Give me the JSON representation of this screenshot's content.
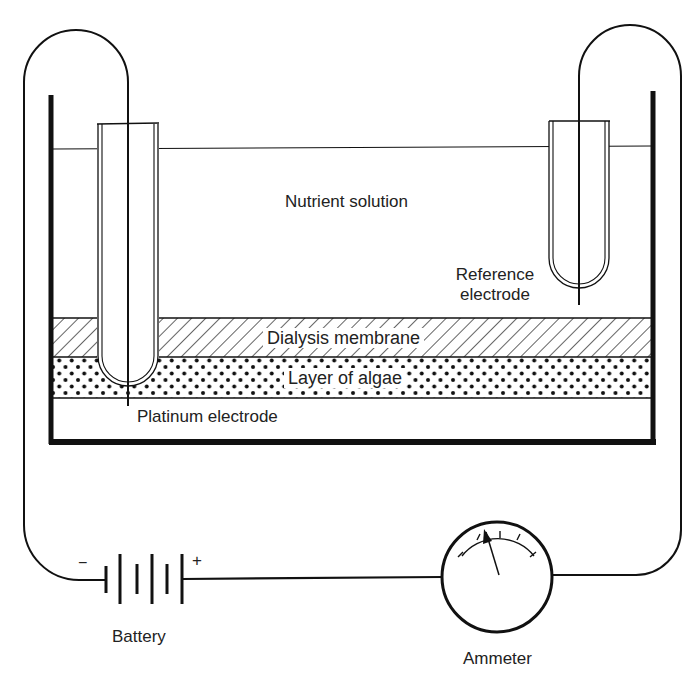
{
  "diagram": {
    "labels": {
      "nutrient_solution": "Nutrient solution",
      "reference_electrode_line1": "Reference",
      "reference_electrode_line2": "electrode",
      "dialysis_membrane": "Dialysis membrane",
      "layer_of_algae": "Layer of algae",
      "platinum_electrode": "Platinum electrode",
      "battery": "Battery",
      "ammeter": "Ammeter",
      "battery_minus": "−",
      "battery_plus": "+"
    },
    "components": [
      {
        "name": "tank",
        "description": "open container holding nutrient solution"
      },
      {
        "name": "nutrient-solution",
        "label_key": "nutrient_solution"
      },
      {
        "name": "dialysis-membrane",
        "label_key": "dialysis_membrane",
        "pattern": "diagonal-hatch"
      },
      {
        "name": "algae-layer",
        "label_key": "layer_of_algae",
        "pattern": "dots"
      },
      {
        "name": "platinum-electrode",
        "label_key": "platinum_electrode"
      },
      {
        "name": "reference-electrode",
        "label_key": "reference_electrode"
      },
      {
        "name": "battery",
        "label_key": "battery",
        "cells": 2
      },
      {
        "name": "ammeter",
        "label_key": "ammeter"
      }
    ],
    "colors": {
      "ink": "#111111",
      "text": "#222222",
      "background": "#ffffff"
    }
  }
}
